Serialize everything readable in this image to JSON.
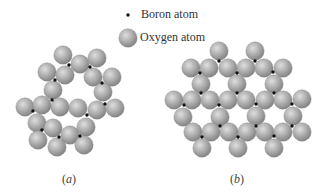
{
  "figure": {
    "legend": {
      "boron_label": "Boron atom",
      "oxygen_label": "Oxygen atom"
    },
    "panels": [
      {
        "id": "a",
        "label_open": "(",
        "label_letter": "a",
        "label_close": ")"
      },
      {
        "id": "b",
        "label_open": "(",
        "label_letter": "b",
        "label_close": ")"
      }
    ],
    "colors": {
      "oxygen_light": "#dcdcdc",
      "oxygen_mid": "#a9a9a9",
      "oxygen_dark": "#7c7c7c",
      "boron": "#111111"
    },
    "oxygen_radius": 9.2,
    "boron_radius": 1.7,
    "structure_a": {
      "oxygen": [
        [
          63,
          55
        ],
        [
          80,
          64
        ],
        [
          97,
          58
        ],
        [
          65,
          75
        ],
        [
          47,
          72
        ],
        [
          93,
          77
        ],
        [
          112,
          77
        ],
        [
          53,
          90
        ],
        [
          103,
          92
        ],
        [
          25,
          107
        ],
        [
          42,
          105
        ],
        [
          60,
          107
        ],
        [
          78,
          108
        ],
        [
          97,
          110
        ],
        [
          115,
          108
        ],
        [
          37,
          123
        ],
        [
          53,
          128
        ],
        [
          70,
          135
        ],
        [
          86,
          127
        ],
        [
          38,
          140
        ],
        [
          57,
          147
        ],
        [
          84,
          145
        ]
      ],
      "boron": [
        [
          69,
          65
        ],
        [
          90,
          67
        ],
        [
          55,
          80
        ],
        [
          102,
          83
        ],
        [
          52,
          100
        ],
        [
          33,
          111
        ],
        [
          105,
          104
        ],
        [
          87,
          115
        ],
        [
          42,
          130
        ],
        [
          59,
          137
        ],
        [
          80,
          136
        ]
      ]
    },
    "structure_b": {
      "oxygen": [
        [
          219,
          51
        ],
        [
          255,
          51
        ],
        [
          191,
          68
        ],
        [
          209,
          68
        ],
        [
          228,
          68
        ],
        [
          246,
          68
        ],
        [
          264,
          68
        ],
        [
          283,
          68
        ],
        [
          201,
          84
        ],
        [
          237,
          84
        ],
        [
          274,
          84
        ],
        [
          174,
          100
        ],
        [
          192,
          100
        ],
        [
          210,
          100
        ],
        [
          228,
          100
        ],
        [
          246,
          100
        ],
        [
          265,
          100
        ],
        [
          283,
          100
        ],
        [
          302,
          99
        ],
        [
          183,
          117
        ],
        [
          220,
          117
        ],
        [
          256,
          116
        ],
        [
          293,
          116
        ],
        [
          193,
          132
        ],
        [
          211,
          132
        ],
        [
          229,
          132
        ],
        [
          247,
          132
        ],
        [
          265,
          132
        ],
        [
          283,
          132
        ],
        [
          302,
          132
        ],
        [
          202,
          148
        ],
        [
          238,
          148
        ],
        [
          274,
          148
        ]
      ],
      "boron": [
        [
          219,
          61
        ],
        [
          255,
          61
        ],
        [
          200,
          73
        ],
        [
          237,
          73
        ],
        [
          273,
          72
        ],
        [
          201,
          93
        ],
        [
          237,
          93
        ],
        [
          274,
          93
        ],
        [
          184,
          105
        ],
        [
          219,
          105
        ],
        [
          256,
          104
        ],
        [
          292,
          104
        ],
        [
          220,
          126
        ],
        [
          256,
          126
        ],
        [
          292,
          126
        ],
        [
          202,
          137
        ],
        [
          238,
          137
        ],
        [
          274,
          136
        ]
      ]
    },
    "legend_icons": {
      "boron": [
        128,
        15
      ],
      "oxygen": [
        128,
        38
      ]
    }
  }
}
